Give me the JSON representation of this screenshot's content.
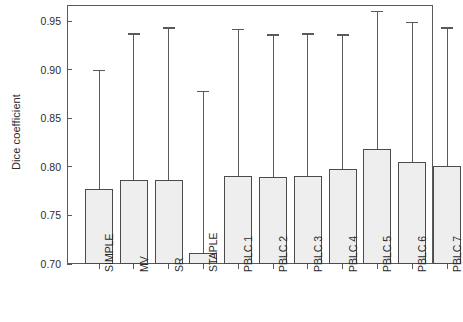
{
  "chart_data": {
    "type": "bar",
    "title": "",
    "subtitle": "",
    "xlabel": "",
    "ylabel": "Dice coefficient",
    "ylim": [
      0.7,
      0.9667
    ],
    "yticks": [
      0.7,
      0.75,
      0.8,
      0.85,
      0.9,
      0.95
    ],
    "ytick_labels": [
      "0.70",
      "0.75",
      "0.80",
      "0.85",
      "0.90",
      "0.95"
    ],
    "grid": false,
    "legend": null,
    "bar_baseline": 0.7,
    "error_bar_style": "upper-whisker-with-cap",
    "categories": [
      "SIMPLE",
      "MV",
      "SR",
      "STAPLE",
      "PBLC 1",
      "PBLC 2",
      "PBLC 3",
      "PBLC 4",
      "PBLC 5",
      "PBLC 6",
      "PBLC 7"
    ],
    "values": [
      0.777,
      0.786,
      0.787,
      0.711,
      0.791,
      0.79,
      0.791,
      0.798,
      0.818,
      0.805,
      0.801
    ],
    "whisker_tops": [
      0.9,
      0.9375,
      0.9437,
      0.8781,
      0.9417,
      0.9365,
      0.9375,
      0.9365,
      0.9604,
      0.949,
      0.9437
    ],
    "bar_fill": "#eeeeee",
    "bar_edge": "#4a4a4a",
    "axis_color": "#5a5a5a",
    "text_color": "#2b2b2b",
    "background": "#ffffff"
  }
}
